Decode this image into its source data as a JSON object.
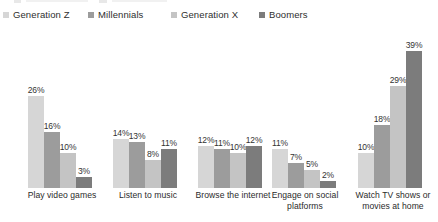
{
  "chart_data": {
    "type": "bar",
    "title": "",
    "subtitle": "",
    "xlabel": "",
    "ylabel": "",
    "ylim": [
      0,
      42
    ],
    "grid": false,
    "legend_position": "top-left",
    "value_suffix": "%",
    "categories": [
      "Play video games",
      "Listen to music",
      "Browse the internet",
      "Engage on social platforms",
      "Watch TV shows or movies at home"
    ],
    "series": [
      {
        "name": "Generation Z",
        "color": "#d6d6d6",
        "values": [
          26,
          14,
          12,
          11,
          10
        ],
        "labels": [
          "26%",
          "14%",
          "12%",
          "11%",
          "10%"
        ]
      },
      {
        "name": "Millennials",
        "color": "#9c9c9c",
        "values": [
          16,
          13,
          11,
          7,
          18
        ],
        "labels": [
          "16%",
          "13%",
          "11%",
          "7%",
          "18%"
        ]
      },
      {
        "name": "Generation X",
        "color": "#c4c4c4",
        "values": [
          10,
          8,
          10,
          5,
          29
        ],
        "labels": [
          "10%",
          "8%",
          "10%",
          "5%",
          "29%"
        ]
      },
      {
        "name": "Boomers",
        "color": "#7c7c7c",
        "values": [
          3,
          11,
          12,
          2,
          39
        ],
        "labels": [
          "3%",
          "11%",
          "12%",
          "2%",
          "39%"
        ]
      }
    ]
  },
  "legend": {
    "items": [
      {
        "label": "Generation Z",
        "color": "#d6d6d6"
      },
      {
        "label": "Millennials",
        "color": "#9c9c9c"
      },
      {
        "label": "Generation X",
        "color": "#c4c4c4"
      },
      {
        "label": "Boomers",
        "color": "#7c7c7c"
      }
    ]
  }
}
